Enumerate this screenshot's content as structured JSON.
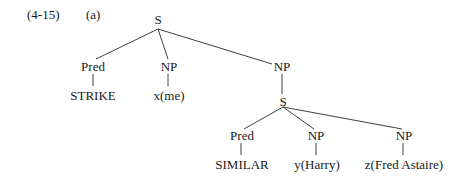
{
  "example": {
    "number": "(4-15)",
    "sublabel": "(a)"
  },
  "tree": {
    "root": "S",
    "root_children": {
      "pred": "Pred",
      "pred_leaf": "STRIKE",
      "np1": "NP",
      "np1_leaf": "x(me)",
      "np2": "NP",
      "np2_child": "S"
    },
    "embedded": {
      "pred": "Pred",
      "pred_leaf": "SIMILAR",
      "np1": "NP",
      "np1_leaf": "y(Harry)",
      "np2": "NP",
      "np2_leaf": "z(Fred Astaire)"
    }
  }
}
